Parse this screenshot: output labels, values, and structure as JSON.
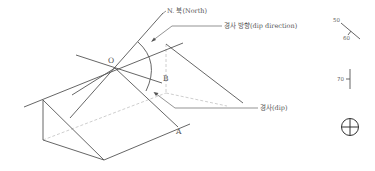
{
  "diagram": {
    "labels": {
      "north": "N. 북(North)",
      "dip_direction": "경사 방향(dip direction)",
      "dip": "경사(dip)",
      "point_o": "O",
      "point_a": "A",
      "point_b": "B"
    },
    "symbols": {
      "strike_dip": {
        "strike_value": "50",
        "dip_value": "60"
      },
      "vertical": {
        "value": "70"
      },
      "horizontal": {
        "name": "horizontal-bed-symbol"
      }
    },
    "colors": {
      "line": "#555555",
      "hidden_line": "#c8c8c8",
      "background": "#ffffff"
    }
  }
}
